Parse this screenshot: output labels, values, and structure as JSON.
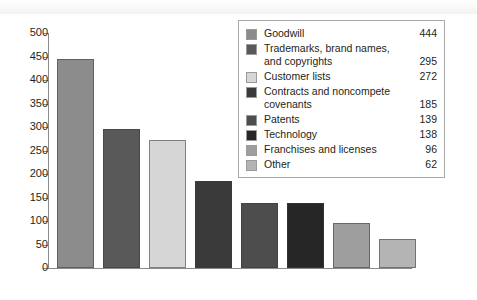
{
  "chart_data": {
    "type": "bar",
    "title": "",
    "subtitle": "",
    "xlabel": "",
    "ylabel": "",
    "categories": [
      "Goodwill",
      "Trademarks, brand names, and copyrights",
      "Customer lists",
      "Contracts and noncompete covenants",
      "Patents",
      "Technology",
      "Franchises and licenses",
      "Other"
    ],
    "values": [
      444,
      295,
      272,
      185,
      139,
      138,
      96,
      62
    ],
    "colors": [
      "#8c8c8c",
      "#595959",
      "#d6d6d6",
      "#3a3a3a",
      "#4d4d4d",
      "#262626",
      "#9e9e9e",
      "#b4b4b4"
    ],
    "ylim": [
      0,
      500
    ],
    "yticks": [
      0,
      50,
      100,
      150,
      200,
      250,
      300,
      350,
      400,
      450,
      500
    ],
    "ytick_labels": [
      "0",
      "50",
      "100",
      "150",
      "200",
      "250",
      "300",
      "350",
      "400",
      "450",
      "500"
    ],
    "xtick_labels": [],
    "grid": false,
    "legend_position": "top-right"
  },
  "legend": {
    "items": [
      {
        "label": "Goodwill",
        "value": "444",
        "color": "#8c8c8c"
      },
      {
        "label": "Trademarks, brand names, and copyrights",
        "value": "295",
        "color": "#595959"
      },
      {
        "label": "Customer lists",
        "value": "272",
        "color": "#d6d6d6"
      },
      {
        "label": "Contracts and noncompete covenants",
        "value": "185",
        "color": "#3a3a3a"
      },
      {
        "label": "Patents",
        "value": "139",
        "color": "#4d4d4d"
      },
      {
        "label": "Technology",
        "value": "138",
        "color": "#262626"
      },
      {
        "label": "Franchises and licenses",
        "value": "96",
        "color": "#9e9e9e"
      },
      {
        "label": "Other",
        "value": "62",
        "color": "#b4b4b4"
      }
    ]
  }
}
